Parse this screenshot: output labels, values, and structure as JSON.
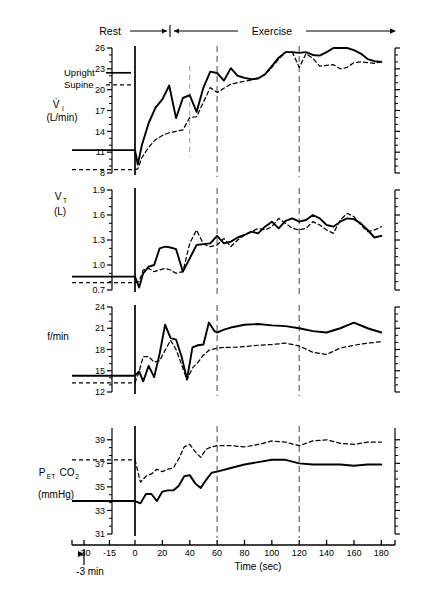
{
  "figure": {
    "phase_labels": {
      "rest": "Rest",
      "exercise": "Exercise"
    },
    "legend": {
      "upright": "Upright",
      "supine": "Supine"
    },
    "xaxis": {
      "label": "Time (sec)",
      "rest_note": "-3 min",
      "tick_labels": [
        "-30",
        "-15",
        "0",
        "20",
        "40",
        "60",
        "80",
        "100",
        "120",
        "140",
        "160",
        "180"
      ],
      "tick_values": [
        -30,
        -15,
        0,
        20,
        40,
        60,
        80,
        100,
        120,
        140,
        160,
        180
      ],
      "range": [
        -40,
        190
      ]
    },
    "colors": {
      "ink": "#000000",
      "marker": "#6f6f6f"
    },
    "markers": [
      60,
      120
    ]
  },
  "chart_data": [
    {
      "type": "line",
      "panel": 1,
      "title": "",
      "ylabel_main": "V̇",
      "ylabel_sub": "I",
      "ylabel_units": "(L/min)",
      "ylim": [
        8,
        26
      ],
      "yticks": [
        8,
        11,
        14,
        17,
        20,
        23,
        26
      ],
      "ytick_labels": [
        "8",
        "11",
        "14",
        "17",
        "20",
        "23",
        "26"
      ],
      "xlabel": "",
      "grid": false,
      "legend_position": "upper-left",
      "series": [
        {
          "name": "Upright",
          "style": "solid",
          "rest": {
            "x": [
              -35,
              0
            ],
            "y": [
              11.3,
              11.3
            ]
          },
          "x": [
            0,
            2,
            5,
            10,
            15,
            20,
            25,
            30,
            35,
            40,
            45,
            50,
            55,
            60,
            65,
            70,
            75,
            80,
            85,
            90,
            95,
            100,
            105,
            110,
            115,
            120,
            125,
            130,
            135,
            140,
            145,
            150,
            155,
            160,
            165,
            170,
            175,
            180
          ],
          "y": [
            11.3,
            9.2,
            12.0,
            15.2,
            17.4,
            18.6,
            20.6,
            15.9,
            18.8,
            19.2,
            16.8,
            20.3,
            22.6,
            22.4,
            21.3,
            23.1,
            22.0,
            21.7,
            21.5,
            21.6,
            22.2,
            23.4,
            24.6,
            25.4,
            25.4,
            25.3,
            25.4,
            25.0,
            24.9,
            25.4,
            26.1,
            26.3,
            26.2,
            25.7,
            25.2,
            24.4,
            24.1,
            24.0
          ]
        },
        {
          "name": "Supine",
          "style": "dashed",
          "rest": {
            "x": [
              -35,
              0
            ],
            "y": [
              8.5,
              8.5
            ]
          },
          "x": [
            0,
            2,
            5,
            10,
            15,
            20,
            25,
            30,
            35,
            40,
            45,
            50,
            55,
            60,
            65,
            70,
            75,
            80,
            85,
            90,
            95,
            100,
            105,
            110,
            115,
            120,
            125,
            130,
            135,
            140,
            145,
            150,
            155,
            160,
            165,
            170,
            175,
            180
          ],
          "y": [
            8.5,
            8.6,
            10.2,
            11.7,
            12.8,
            13.4,
            13.8,
            14.0,
            14.2,
            16.0,
            16.1,
            18.2,
            20.3,
            19.6,
            20.2,
            20.8,
            21.0,
            21.2,
            21.4,
            21.7,
            22.2,
            23.2,
            24.4,
            25.4,
            25.4,
            23.2,
            25.2,
            24.5,
            23.4,
            23.5,
            23.6,
            23.0,
            23.2,
            23.9,
            24.0,
            23.9,
            23.8,
            24.0
          ]
        }
      ]
    },
    {
      "type": "line",
      "panel": 2,
      "title": "",
      "ylabel_main": "V",
      "ylabel_sub": "T",
      "ylabel_units": "(L)",
      "ylim": [
        0.7,
        1.9
      ],
      "yticks": [
        0.7,
        1.0,
        1.3,
        1.6,
        1.9
      ],
      "ytick_labels": [
        "0.7",
        "1.0",
        "1.3",
        "1.6",
        "1.9"
      ],
      "xlabel": "",
      "grid": false,
      "series": [
        {
          "name": "Upright",
          "style": "solid",
          "rest": {
            "x": [
              -35,
              0
            ],
            "y": [
              0.86,
              0.86
            ]
          },
          "x": [
            0,
            3,
            6,
            10,
            14,
            18,
            22,
            26,
            30,
            35,
            40,
            45,
            50,
            55,
            60,
            65,
            70,
            75,
            80,
            85,
            90,
            95,
            100,
            105,
            110,
            115,
            120,
            125,
            130,
            135,
            140,
            145,
            150,
            155,
            160,
            165,
            170,
            175,
            180
          ],
          "y": [
            0.86,
            0.73,
            0.9,
            0.98,
            1.0,
            1.2,
            1.22,
            1.21,
            1.19,
            0.92,
            1.08,
            1.24,
            1.25,
            1.26,
            1.35,
            1.26,
            1.28,
            1.33,
            1.36,
            1.4,
            1.38,
            1.46,
            1.52,
            1.44,
            1.53,
            1.56,
            1.52,
            1.54,
            1.6,
            1.56,
            1.48,
            1.46,
            1.52,
            1.56,
            1.55,
            1.5,
            1.42,
            1.33,
            1.35
          ]
        },
        {
          "name": "Supine",
          "style": "dashed",
          "rest": {
            "x": [
              -35,
              0
            ],
            "y": [
              0.79,
              0.79
            ]
          },
          "x": [
            0,
            3,
            6,
            10,
            14,
            18,
            22,
            26,
            30,
            35,
            40,
            45,
            50,
            55,
            60,
            65,
            70,
            75,
            80,
            85,
            90,
            95,
            100,
            105,
            110,
            115,
            120,
            125,
            130,
            135,
            140,
            145,
            150,
            155,
            160,
            165,
            170,
            175,
            180
          ],
          "y": [
            0.79,
            0.8,
            0.94,
            0.96,
            0.92,
            0.94,
            0.96,
            0.94,
            0.9,
            0.92,
            1.26,
            1.42,
            1.25,
            1.22,
            1.24,
            1.32,
            1.22,
            1.3,
            1.36,
            1.4,
            1.44,
            1.42,
            1.46,
            1.56,
            1.5,
            1.44,
            1.42,
            1.44,
            1.52,
            1.48,
            1.42,
            1.38,
            1.54,
            1.62,
            1.58,
            1.48,
            1.4,
            1.42,
            1.46
          ]
        }
      ]
    },
    {
      "type": "line",
      "panel": 3,
      "title": "",
      "ylabel_main": "f/min",
      "ylabel_sub": "",
      "ylabel_units": "",
      "ylim": [
        12,
        24
      ],
      "yticks": [
        12,
        15,
        18,
        21,
        24
      ],
      "ytick_labels": [
        "12",
        "15",
        "18",
        "21",
        "24"
      ],
      "xlabel": "",
      "grid": false,
      "series": [
        {
          "name": "Upright",
          "style": "solid",
          "rest": {
            "x": [
              -35,
              0
            ],
            "y": [
              14.3,
              14.3
            ]
          },
          "x": [
            0,
            3,
            6,
            10,
            14,
            18,
            22,
            26,
            30,
            34,
            38,
            42,
            46,
            50,
            54,
            58,
            60,
            65,
            70,
            80,
            90,
            100,
            110,
            120,
            130,
            140,
            150,
            160,
            170,
            180
          ],
          "y": [
            14.3,
            14.9,
            13.5,
            15.7,
            14.1,
            17.4,
            21.5,
            19.6,
            19.4,
            17.0,
            13.8,
            18.3,
            18.6,
            18.7,
            21.8,
            20.6,
            20.4,
            20.8,
            21.1,
            21.5,
            21.6,
            21.4,
            21.3,
            21.0,
            20.6,
            20.4,
            21.0,
            21.8,
            21.0,
            20.4
          ]
        },
        {
          "name": "Supine",
          "style": "dashed",
          "rest": {
            "x": [
              -35,
              0
            ],
            "y": [
              13.3,
              13.3
            ]
          },
          "x": [
            0,
            3,
            6,
            10,
            14,
            18,
            22,
            26,
            30,
            34,
            38,
            42,
            46,
            50,
            54,
            58,
            60,
            65,
            70,
            80,
            90,
            100,
            110,
            120,
            130,
            140,
            150,
            160,
            170,
            180
          ],
          "y": [
            13.3,
            14.9,
            17.0,
            17.0,
            16.2,
            16.4,
            17.9,
            19.3,
            18.0,
            15.9,
            13.7,
            15.4,
            16.2,
            17.2,
            17.9,
            18.1,
            18.2,
            18.3,
            18.3,
            18.4,
            18.6,
            18.7,
            18.9,
            18.5,
            17.6,
            17.3,
            18.2,
            18.6,
            18.9,
            19.1
          ]
        }
      ]
    },
    {
      "type": "line",
      "panel": 4,
      "title": "",
      "ylabel_main": "P",
      "ylabel_sub": "ET",
      "ylabel_main2": "CO",
      "ylabel_sub2": "2",
      "ylabel_units": "(mmHg)",
      "ylim": [
        31,
        40
      ],
      "yticks": [
        31,
        33,
        35,
        37,
        39
      ],
      "ytick_labels": [
        "31",
        "33",
        "35",
        "37",
        "39"
      ],
      "xlabel": "Time (sec)",
      "grid": false,
      "series": [
        {
          "name": "Upright",
          "style": "solid",
          "rest": {
            "x": [
              -35,
              0
            ],
            "y": [
              33.8,
              33.8
            ]
          },
          "x": [
            0,
            4,
            8,
            12,
            16,
            20,
            24,
            28,
            32,
            36,
            40,
            44,
            48,
            52,
            56,
            60,
            70,
            80,
            90,
            100,
            110,
            120,
            130,
            140,
            150,
            160,
            170,
            180
          ],
          "y": [
            33.8,
            33.6,
            34.4,
            34.4,
            33.8,
            34.6,
            34.7,
            34.7,
            35.1,
            35.9,
            36.0,
            35.3,
            34.9,
            35.6,
            36.2,
            36.3,
            36.6,
            36.9,
            37.1,
            37.3,
            37.3,
            37.0,
            36.9,
            36.9,
            36.9,
            36.8,
            36.9,
            36.9
          ]
        },
        {
          "name": "Supine",
          "style": "dashed",
          "rest": {
            "x": [
              -35,
              0
            ],
            "y": [
              37.3,
              37.3
            ]
          },
          "x": [
            0,
            4,
            8,
            12,
            16,
            20,
            24,
            28,
            32,
            36,
            40,
            44,
            48,
            52,
            56,
            60,
            70,
            80,
            90,
            100,
            110,
            120,
            130,
            140,
            150,
            160,
            170,
            180
          ],
          "y": [
            37.3,
            35.4,
            35.9,
            36.1,
            36.5,
            36.3,
            36.5,
            36.6,
            37.4,
            38.4,
            38.6,
            38.0,
            37.5,
            38.2,
            38.4,
            38.5,
            38.5,
            38.4,
            38.6,
            38.9,
            38.8,
            38.5,
            38.9,
            39.0,
            38.7,
            38.6,
            38.8,
            38.8
          ]
        }
      ]
    }
  ]
}
